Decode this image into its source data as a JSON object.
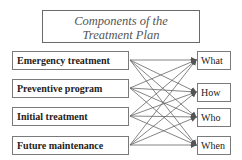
{
  "title": {
    "line1": "Components of the",
    "line2": "Treatment Plan"
  },
  "components": [
    {
      "label": "Emergency treatment"
    },
    {
      "label": "Preventive program"
    },
    {
      "label": "Initial treatment"
    },
    {
      "label": "Future maintenance"
    }
  ],
  "questions": [
    {
      "label": "What"
    },
    {
      "label": "How"
    },
    {
      "label": "Who"
    },
    {
      "label": "When"
    }
  ],
  "connections": "every component connects to every question (4x4 arrows)"
}
